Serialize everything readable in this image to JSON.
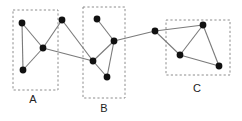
{
  "figure": {
    "width": 242,
    "height": 121,
    "background": "#ffffff",
    "node_color": "#111111",
    "edge_color": "#7a7a7a",
    "box_color": "#8c8c8c",
    "label_color": "#222222"
  },
  "chart_data": {
    "type": "scatter",
    "title": "",
    "xlabel": "",
    "ylabel": "",
    "grid": false,
    "legend": "none",
    "xlim": [
      0,
      242
    ],
    "ylim": [
      0,
      121
    ],
    "nodes": [
      {
        "id": "a1",
        "x": 22,
        "y": 23,
        "cluster": "A"
      },
      {
        "id": "a2",
        "x": 43,
        "y": 48,
        "cluster": "A"
      },
      {
        "id": "a3",
        "x": 23,
        "y": 70,
        "cluster": "A"
      },
      {
        "id": "n1",
        "x": 62,
        "y": 20,
        "cluster": ""
      },
      {
        "id": "b1",
        "x": 97,
        "y": 19,
        "cluster": "B"
      },
      {
        "id": "b2",
        "x": 114,
        "y": 41,
        "cluster": "B"
      },
      {
        "id": "b3",
        "x": 93,
        "y": 61,
        "cluster": "B"
      },
      {
        "id": "b4",
        "x": 107,
        "y": 77,
        "cluster": "B"
      },
      {
        "id": "c0",
        "x": 155,
        "y": 31,
        "cluster": ""
      },
      {
        "id": "c1",
        "x": 203,
        "y": 25,
        "cluster": "C"
      },
      {
        "id": "c2",
        "x": 180,
        "y": 55,
        "cluster": "C"
      },
      {
        "id": "c3",
        "x": 219,
        "y": 66,
        "cluster": "C"
      }
    ],
    "edges": [
      {
        "source": "a1",
        "target": "a2"
      },
      {
        "source": "a1",
        "target": "a3"
      },
      {
        "source": "a2",
        "target": "a3"
      },
      {
        "source": "a2",
        "target": "n1"
      },
      {
        "source": "a2",
        "target": "b3"
      },
      {
        "source": "n1",
        "target": "b3"
      },
      {
        "source": "b1",
        "target": "b2"
      },
      {
        "source": "b2",
        "target": "b3"
      },
      {
        "source": "b2",
        "target": "b4"
      },
      {
        "source": "b3",
        "target": "b4"
      },
      {
        "source": "b2",
        "target": "c0"
      },
      {
        "source": "c0",
        "target": "c1"
      },
      {
        "source": "c0",
        "target": "c2"
      },
      {
        "source": "c1",
        "target": "c2"
      },
      {
        "source": "c1",
        "target": "c3"
      },
      {
        "source": "c2",
        "target": "c3"
      }
    ],
    "clusters": [
      {
        "id": "A",
        "label": "A",
        "x": 13,
        "y": 10,
        "width": 45,
        "height": 80,
        "label_x": 33,
        "label_y": 100
      },
      {
        "id": "B",
        "label": "B",
        "x": 83,
        "y": 7,
        "width": 42,
        "height": 91,
        "label_x": 104,
        "label_y": 109
      },
      {
        "id": "C",
        "label": "C",
        "x": 166,
        "y": 20,
        "width": 64,
        "height": 55,
        "label_x": 197,
        "label_y": 89
      }
    ]
  }
}
